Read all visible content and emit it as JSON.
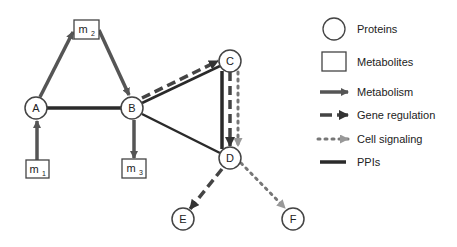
{
  "diagram": {
    "nodes": [
      {
        "id": "A",
        "type": "protein",
        "label": "A"
      },
      {
        "id": "B",
        "type": "protein",
        "label": "B"
      },
      {
        "id": "C",
        "type": "protein",
        "label": "C"
      },
      {
        "id": "D",
        "type": "protein",
        "label": "D"
      },
      {
        "id": "E",
        "type": "protein",
        "label": "E"
      },
      {
        "id": "F",
        "type": "protein",
        "label": "F"
      },
      {
        "id": "m1",
        "type": "metabolite",
        "label": "m",
        "sub": "1"
      },
      {
        "id": "m2",
        "type": "metabolite",
        "label": "m",
        "sub": "2"
      },
      {
        "id": "m3",
        "type": "metabolite",
        "label": "m",
        "sub": "3"
      }
    ],
    "edges": [
      {
        "from": "m1",
        "to": "A",
        "type": "Metabolism"
      },
      {
        "from": "A",
        "to": "m2",
        "type": "Metabolism"
      },
      {
        "from": "m2",
        "to": "B",
        "type": "Metabolism"
      },
      {
        "from": "B",
        "to": "m3",
        "type": "Metabolism"
      },
      {
        "from": "A",
        "to": "B",
        "type": "PPIs"
      },
      {
        "from": "B",
        "to": "C",
        "type": "PPIs"
      },
      {
        "from": "B",
        "to": "C",
        "type": "Gene regulation"
      },
      {
        "from": "B",
        "to": "D",
        "type": "PPIs"
      },
      {
        "from": "C",
        "to": "D",
        "type": "PPIs"
      },
      {
        "from": "C",
        "to": "D",
        "type": "Gene regulation"
      },
      {
        "from": "C",
        "to": "D",
        "type": "Cell signaling"
      },
      {
        "from": "D",
        "to": "E",
        "type": "Gene regulation"
      },
      {
        "from": "D",
        "to": "F",
        "type": "Cell signaling"
      }
    ]
  },
  "legend": {
    "items": [
      {
        "symbol": "circle",
        "label": "Proteins"
      },
      {
        "symbol": "square",
        "label": "Metabolites"
      },
      {
        "symbol": "solid-arrow",
        "label": "Metabolism"
      },
      {
        "symbol": "dashed-arrow",
        "label": "Gene regulation"
      },
      {
        "symbol": "dotted-arrow",
        "label": "Cell signaling"
      },
      {
        "symbol": "thick-line",
        "label": "PPIs"
      }
    ]
  },
  "colors": {
    "metabolism": "#555555",
    "gene_regulation": "#444444",
    "cell_signaling": "#777777",
    "ppi": "#222222",
    "node_stroke": "#444444"
  }
}
